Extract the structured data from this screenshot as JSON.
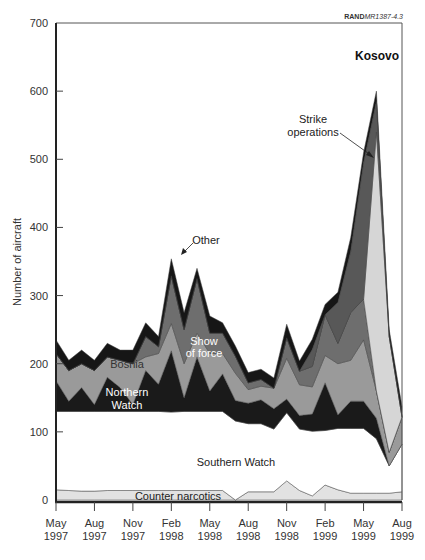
{
  "source_tag": {
    "bold": "RAND",
    "italic": "MR1387-4.3"
  },
  "chart_data": {
    "type": "area",
    "stacked": true,
    "title": "",
    "xlabel": "",
    "ylabel": "Number of aircraft",
    "ylim": [
      0,
      700
    ],
    "yticks": [
      0,
      100,
      200,
      300,
      400,
      500,
      600,
      700
    ],
    "xticks": [
      "May\n1997",
      "Aug\n1997",
      "Nov\n1997",
      "Feb\n1998",
      "May\n1998",
      "Aug\n1998",
      "Nov\n1998",
      "Feb\n1999",
      "May\n1999",
      "Aug\n1999"
    ],
    "x_months": [
      0,
      1,
      2,
      3,
      4,
      5,
      6,
      7,
      8,
      9,
      10,
      11,
      12,
      13,
      14,
      15,
      16,
      17,
      18,
      19,
      20,
      21,
      22,
      23,
      24,
      25,
      26,
      27
    ],
    "x_labels_monthly": [
      "May 1997",
      "Jun 1997",
      "Jul 1997",
      "Aug 1997",
      "Sep 1997",
      "Oct 1997",
      "Nov 1997",
      "Dec 1997",
      "Jan 1998",
      "Feb 1998",
      "Mar 1998",
      "Apr 1998",
      "May 1998",
      "Jun 1998",
      "Jul 1998",
      "Aug 1998",
      "Sep 1998",
      "Oct 1998",
      "Nov 1998",
      "Dec 1998",
      "Jan 1999",
      "Feb 1999",
      "Mar 1999",
      "Apr 1999",
      "May 1999",
      "Jun 1999",
      "Jul 1999",
      "Aug 1999"
    ],
    "series": [
      {
        "name": "Counter narcotics",
        "color": "#e2e2e2",
        "values": [
          15,
          14,
          13,
          13,
          14,
          14,
          14,
          14,
          14,
          14,
          14,
          14,
          14,
          14,
          0,
          12,
          12,
          12,
          28,
          14,
          6,
          22,
          15,
          10,
          10,
          10,
          10,
          12
        ]
      },
      {
        "name": "Southern Watch",
        "color": "#ffffff",
        "values": [
          115,
          116,
          117,
          117,
          116,
          116,
          116,
          116,
          116,
          115,
          116,
          116,
          116,
          116,
          116,
          100,
          100,
          92,
          100,
          90,
          95,
          80,
          90,
          95,
          95,
          80,
          40,
          70
        ]
      },
      {
        "name": "Northern Watch",
        "color": "#1a1a1a",
        "values": [
          45,
          15,
          35,
          10,
          50,
          35,
          10,
          60,
          40,
          90,
          20,
          80,
          30,
          55,
          30,
          30,
          35,
          30,
          20,
          20,
          25,
          70,
          20,
          40,
          40,
          30,
          0,
          0
        ]
      },
      {
        "name": "Bosnia",
        "color": "#9a9a9a",
        "values": [
          40,
          45,
          35,
          50,
          30,
          40,
          60,
          20,
          45,
          40,
          50,
          35,
          55,
          30,
          40,
          20,
          20,
          30,
          60,
          45,
          40,
          40,
          75,
          60,
          90,
          40,
          20,
          40
        ]
      },
      {
        "name": "Show of force",
        "color": "#6e6e6e",
        "values": [
          0,
          0,
          0,
          0,
          0,
          0,
          0,
          30,
          10,
          70,
          50,
          80,
          30,
          30,
          25,
          10,
          10,
          0,
          30,
          20,
          30,
          60,
          30,
          70,
          60,
          0,
          0,
          0
        ]
      },
      {
        "name": "Strike operations",
        "color": "#d6d6d6",
        "values": [
          0,
          0,
          0,
          0,
          0,
          0,
          0,
          0,
          0,
          0,
          0,
          0,
          0,
          0,
          0,
          0,
          0,
          0,
          0,
          0,
          0,
          0,
          0,
          0,
          0,
          380,
          170,
          0
        ]
      },
      {
        "name": "Kosovo",
        "color": "#585858",
        "values": [
          0,
          0,
          0,
          0,
          0,
          0,
          0,
          0,
          0,
          0,
          0,
          0,
          0,
          0,
          0,
          0,
          0,
          0,
          0,
          0,
          25,
          0,
          60,
          90,
          200,
          45,
          0,
          0
        ]
      },
      {
        "name": "Other",
        "color": "#161616",
        "values": [
          20,
          15,
          20,
          15,
          20,
          15,
          20,
          20,
          15,
          25,
          25,
          15,
          25,
          15,
          15,
          15,
          15,
          15,
          20,
          15,
          15,
          15,
          15,
          20,
          15,
          15,
          10,
          15
        ]
      }
    ],
    "annotations": [
      {
        "text": "Kosovo",
        "bold": true
      },
      {
        "text": "Strike operations",
        "arrow": true
      },
      {
        "text": "Other",
        "arrow": true
      },
      {
        "text": "Show of force"
      },
      {
        "text": "Bosnia"
      },
      {
        "text": "Northern Watch"
      },
      {
        "text": "Southern Watch"
      },
      {
        "text": "Counter narcotics"
      }
    ],
    "grid": false,
    "legend": "inline labels"
  },
  "labels": {
    "kosovo": "Kosovo",
    "strike1": "Strike",
    "strike2": "operations",
    "other": "Other",
    "show1": "Show",
    "show2": "of force",
    "bosnia": "Bosnia",
    "northern1": "Northern",
    "northern2": "Watch",
    "southern": "Southern Watch",
    "counter": "Counter narcotics"
  }
}
